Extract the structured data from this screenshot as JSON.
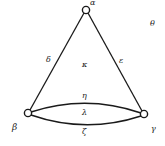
{
  "diagram": {
    "type": "graph",
    "vertices": [
      {
        "id": "alpha",
        "label": "α",
        "x": 86,
        "y": 10
      },
      {
        "id": "beta",
        "label": "β",
        "x": 28,
        "y": 113
      },
      {
        "id": "gamma",
        "label": "γ",
        "x": 144,
        "y": 114
      }
    ],
    "edges": [
      {
        "id": "delta",
        "label": "δ",
        "from": "alpha",
        "to": "beta"
      },
      {
        "id": "epsilon",
        "label": "ε",
        "from": "alpha",
        "to": "gamma"
      },
      {
        "id": "eta",
        "label": "η",
        "from": "beta",
        "to": "gamma",
        "shape": "upper-arc"
      },
      {
        "id": "zeta",
        "label": "ζ",
        "from": "beta",
        "to": "gamma",
        "shape": "lower-arc"
      }
    ],
    "faces": [
      {
        "id": "kappa",
        "label": "κ"
      },
      {
        "id": "lambda",
        "label": "λ"
      },
      {
        "id": "theta",
        "label": "θ",
        "note": "outer face"
      }
    ],
    "colors": {
      "stroke": "#1a1a1a",
      "background": "#ffffff"
    }
  }
}
